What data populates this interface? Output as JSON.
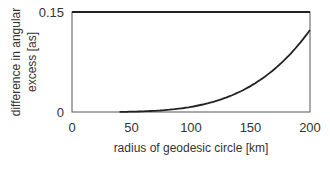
{
  "chart_data": {
    "type": "line",
    "title": "",
    "xlabel": "radius of geodesic circle [km]",
    "ylabel_lines": [
      "difference in angular",
      "excess [as]"
    ],
    "ylabel": "difference in angular excess [as]",
    "xlim": [
      0,
      200
    ],
    "ylim": [
      0,
      0.15
    ],
    "xticks": [
      0,
      50,
      100,
      150,
      200
    ],
    "xtick_labels": [
      "0",
      "50",
      "100",
      "150",
      "200"
    ],
    "yticks": [
      0,
      0.15
    ],
    "ytick_labels": [
      "0",
      "0.15"
    ],
    "grid": false,
    "legend": null,
    "series": [
      {
        "name": "difference in angular excess",
        "x": [
          0,
          25,
          50,
          75,
          100,
          125,
          150,
          175,
          200
        ],
        "y": [
          0,
          3e-05,
          0.0005,
          0.0024,
          0.0077,
          0.0188,
          0.039,
          0.072,
          0.123
        ]
      }
    ]
  },
  "caption_partial": ""
}
